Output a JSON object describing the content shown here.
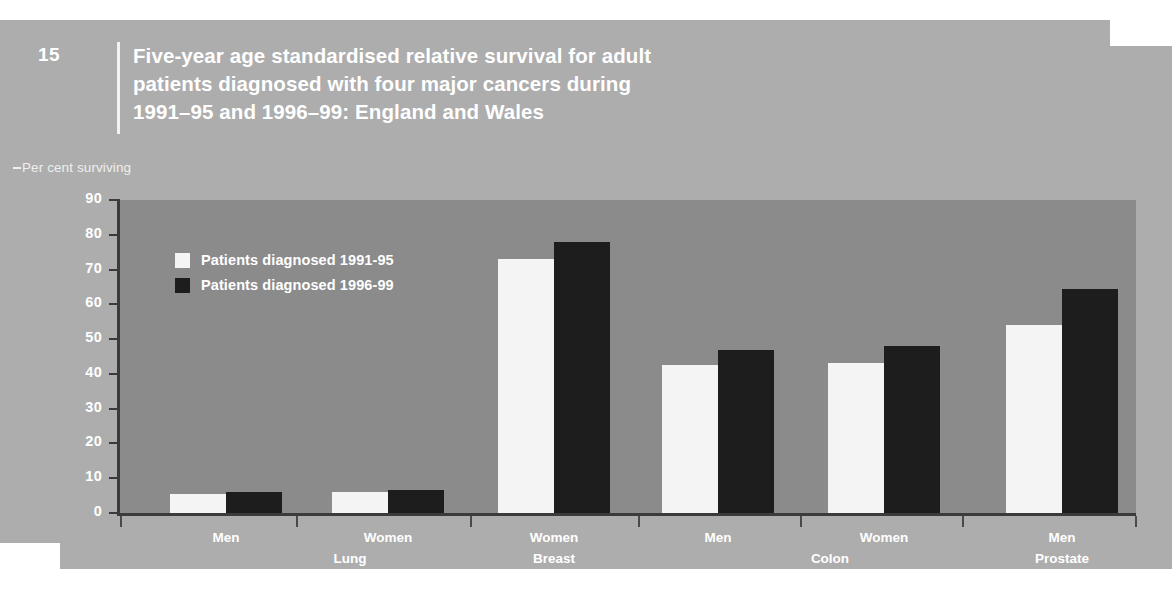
{
  "figure": {
    "number": "15",
    "title_lines": [
      "Five-year age standardised relative survival for adult",
      "patients diagnosed with four major cancers during",
      "1991–95 and 1996–99: England and Wales"
    ],
    "axis_note": "Per cent surviving"
  },
  "colors": {
    "page_background": "#adadad",
    "plot_background": "#8b8b8b",
    "series_1991_95": "#f4f4f4",
    "series_1996_99": "#1d1d1d",
    "axis": "#3b3b3b",
    "text": "#ffffff"
  },
  "chart_data": {
    "type": "bar",
    "title": "Five-year age standardised relative survival for adult patients diagnosed with four major cancers during 1991–95 and 1996–99: England and Wales",
    "xlabel": "",
    "ylabel": "Per cent surviving",
    "ylim": [
      0,
      90
    ],
    "yticks": [
      0,
      10,
      20,
      30,
      40,
      50,
      60,
      70,
      80,
      90
    ],
    "ytick_labels": [
      "0",
      "10",
      "20",
      "30",
      "40",
      "50",
      "60",
      "70",
      "80",
      "90"
    ],
    "grid": false,
    "legend_position": "upper-left",
    "categories": [
      "Men",
      "Women",
      "Women",
      "Men",
      "Women",
      "Men"
    ],
    "cancer_groups": [
      {
        "name": "Lung",
        "columns": [
          "Men",
          "Women"
        ]
      },
      {
        "name": "Breast",
        "columns": [
          "Women"
        ]
      },
      {
        "name": "Colon",
        "columns": [
          "Men",
          "Women"
        ]
      },
      {
        "name": "Prostate",
        "columns": [
          "Men"
        ]
      }
    ],
    "series": [
      {
        "name": "Patients diagnosed 1991-95",
        "color": "#f4f4f4",
        "values": [
          5.5,
          6,
          73,
          42.5,
          43,
          54
        ]
      },
      {
        "name": "Patients diagnosed 1996-99",
        "color": "#1d1d1d",
        "values": [
          6,
          6.5,
          78,
          47,
          48,
          64.5
        ]
      }
    ]
  },
  "group_positions": [
    {
      "label": "Lung",
      "center": 350
    },
    {
      "label": "Breast",
      "center": 554
    },
    {
      "label": "Colon",
      "center": 830
    },
    {
      "label": "Prostate",
      "center": 1062
    }
  ],
  "column_positions": [
    {
      "label": "Men",
      "center": 226
    },
    {
      "label": "Women",
      "center": 388
    },
    {
      "label": "Women",
      "center": 554
    },
    {
      "label": "Men",
      "center": 718
    },
    {
      "label": "Women",
      "center": 884
    },
    {
      "label": "Men",
      "center": 1062
    }
  ],
  "xtick_positions": [
    120,
    296,
    470,
    638,
    800,
    962,
    1135
  ]
}
